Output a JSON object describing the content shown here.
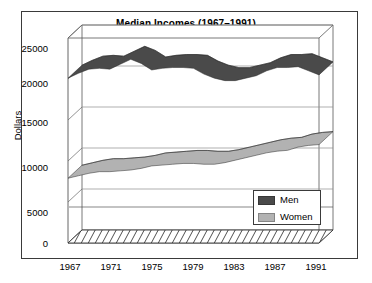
{
  "chart_data": {
    "type": "area",
    "title": "Median Incomes (1967–1991)",
    "xlabel": "",
    "ylabel": "Dollars",
    "ylim": [
      0,
      25000
    ],
    "xlim": [
      1967,
      1991
    ],
    "ytick_labels": [
      "0",
      "5000",
      "10000",
      "15000",
      "20000",
      "25000"
    ],
    "ytick_values": [
      0,
      5000,
      10000,
      15000,
      20000,
      25000
    ],
    "xtick_labels": [
      "1967",
      "1971",
      "1975",
      "1979",
      "1983",
      "1987",
      "1991"
    ],
    "xtick_values": [
      1967,
      1971,
      1975,
      1979,
      1983,
      1987,
      1991
    ],
    "grid": true,
    "legend_position": "bottom-right",
    "x": [
      1967,
      1968,
      1969,
      1970,
      1971,
      1972,
      1973,
      1974,
      1975,
      1976,
      1977,
      1978,
      1979,
      1980,
      1981,
      1982,
      1983,
      1984,
      1985,
      1986,
      1987,
      1988,
      1989,
      1990,
      1991
    ],
    "series": [
      {
        "name": "Men",
        "color": "#4a4a4a",
        "values": [
          20100,
          20700,
          21200,
          21300,
          21200,
          21800,
          22400,
          21900,
          21100,
          21300,
          21400,
          21400,
          21300,
          20600,
          20100,
          19800,
          19800,
          20100,
          20400,
          21000,
          21400,
          21400,
          21500,
          21000,
          20500
        ]
      },
      {
        "name": "Women",
        "color": "#b2b2b2",
        "values": [
          7900,
          8200,
          8500,
          8700,
          8700,
          8800,
          8900,
          9100,
          9400,
          9500,
          9600,
          9700,
          9700,
          9600,
          9600,
          9800,
          10100,
          10400,
          10700,
          11000,
          11200,
          11300,
          11700,
          11900,
          12000
        ]
      }
    ]
  },
  "legend": {
    "items": [
      {
        "label": "Men",
        "color": "#4a4a4a"
      },
      {
        "label": "Women",
        "color": "#b2b2b2"
      }
    ]
  },
  "axes": {
    "y_axis_title": "Dollars"
  }
}
